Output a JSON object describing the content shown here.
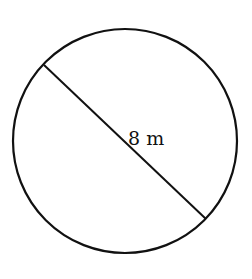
{
  "diagram": {
    "shape": "circle",
    "circle": {
      "cx": 125,
      "cy": 141,
      "r": 112,
      "stroke": "#111111",
      "stroke_width": 2.2
    },
    "diameter": {
      "x1": 44,
      "y1": 65,
      "x2": 206,
      "y2": 219,
      "stroke": "#111111",
      "stroke_width": 2
    },
    "label": {
      "text": "8 m",
      "x": 128,
      "y": 145
    }
  }
}
